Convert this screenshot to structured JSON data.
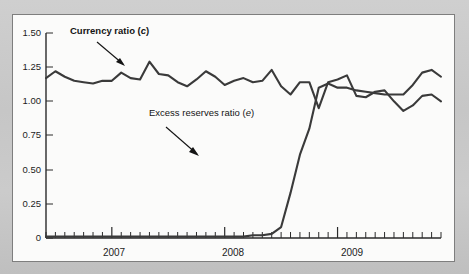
{
  "figure": {
    "background_color": "#c8c8c8",
    "card_color": "#fbfbfa",
    "line_color": "#3a3a3a",
    "text_color": "#141414"
  },
  "annotations": {
    "currency": {
      "text_main": "Currency ratio (",
      "text_italic": "c",
      "text_close": ")",
      "full": "Currency ratio (c)"
    },
    "excess": {
      "text_main": "Excess reserves ratio (",
      "text_italic": "e",
      "text_close": ")",
      "full": "Excess reserves ratio (e)"
    }
  },
  "chart_data": {
    "type": "line",
    "title": "",
    "subtitle": "",
    "xlabel": "",
    "ylabel": "",
    "ylim": [
      0,
      1.5
    ],
    "yticks": [
      0,
      0.25,
      0.5,
      0.75,
      1.0,
      1.25,
      1.5
    ],
    "ytick_labels": [
      "0",
      "0.25",
      "0.50",
      "0.75",
      "1.00",
      "1.25",
      "1.50"
    ],
    "xtick_labels": [
      "2007",
      "2008",
      "2009"
    ],
    "x_major_positions": [
      7,
      19,
      31
    ],
    "x_start_label": "mid-2006",
    "x_end_label": "late-2009",
    "n_points": 43,
    "grid": false,
    "legend": "none (inline annotations with leader arrows)",
    "series": [
      {
        "name": "Currency ratio (c)",
        "values": [
          1.17,
          1.22,
          1.18,
          1.15,
          1.14,
          1.13,
          1.15,
          1.15,
          1.21,
          1.17,
          1.16,
          1.29,
          1.2,
          1.19,
          1.14,
          1.11,
          1.16,
          1.22,
          1.18,
          1.12,
          1.15,
          1.17,
          1.14,
          1.15,
          1.23,
          1.11,
          1.05,
          1.14,
          1.14,
          0.95,
          1.14,
          1.16,
          1.19,
          1.04,
          1.03,
          1.07,
          1.08,
          1.0,
          0.93,
          0.97,
          1.04,
          1.05,
          1.0
        ]
      },
      {
        "name": "Excess reserves ratio (e)",
        "values": [
          0.01,
          0.01,
          0.01,
          0.01,
          0.01,
          0.01,
          0.01,
          0.01,
          0.01,
          0.01,
          0.01,
          0.01,
          0.01,
          0.01,
          0.01,
          0.01,
          0.01,
          0.01,
          0.01,
          0.01,
          0.01,
          0.01,
          0.02,
          0.02,
          0.03,
          0.08,
          0.33,
          0.61,
          0.8,
          1.1,
          1.13,
          1.1,
          1.1,
          1.08,
          1.07,
          1.06,
          1.05,
          1.05,
          1.05,
          1.12,
          1.21,
          1.23,
          1.18
        ]
      }
    ]
  }
}
